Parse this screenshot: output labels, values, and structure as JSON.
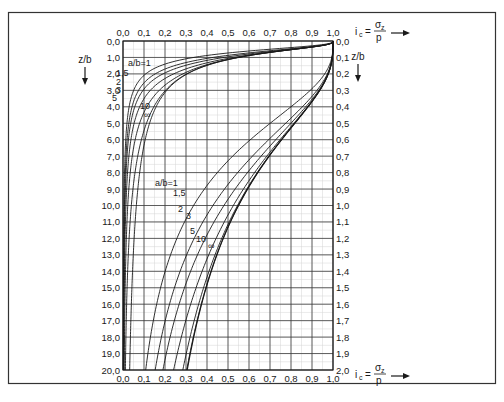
{
  "chart_data": {
    "type": "line",
    "title": "",
    "x_axis": {
      "label_prefix": "i",
      "label_sub": "c",
      "label_eq": "=",
      "label_num": "σ",
      "label_num_sub": "z",
      "label_den": "p",
      "range": [
        0.0,
        1.0
      ],
      "ticks": [
        "0,0",
        "0,1",
        "0,2",
        "0,3",
        "0,4",
        "0,5",
        "0,6",
        "0,7",
        "0,8",
        "0,9",
        "1,0"
      ],
      "positions": [
        "top",
        "bottom"
      ]
    },
    "left_axis": {
      "label": "z/b",
      "range": [
        0.0,
        20.0
      ],
      "inverted": true,
      "ticks": [
        "0,0",
        "1,0",
        "2,0",
        "3,0",
        "4,0",
        "5,0",
        "6,0",
        "7,0",
        "8,0",
        "9,0",
        "10,0",
        "11,0",
        "12,0",
        "13,0",
        "14,0",
        "15,0",
        "16,0",
        "17,0",
        "18,0",
        "19,0",
        "20,0"
      ]
    },
    "right_axis": {
      "label": "z/b",
      "range": [
        0.0,
        2.0
      ],
      "inverted": true,
      "ticks": [
        "0,0",
        "0,1",
        "0,2",
        "0,3",
        "0,4",
        "0,5",
        "0,6",
        "0,7",
        "0,8",
        "0,9",
        "1,0",
        "1,1",
        "1,2",
        "1,3",
        "1,4",
        "1,5",
        "1,6",
        "1,7",
        "1,8",
        "1,9",
        "2,0"
      ]
    },
    "grid": true,
    "minor_grid": true,
    "ratios": [
      "1",
      "1,5",
      "2",
      "3",
      "5",
      "10",
      "∞"
    ],
    "ratio_values": [
      1,
      1.5,
      2,
      3,
      5,
      10,
      1000
    ],
    "families": [
      {
        "name": "left-scale",
        "axis": "left",
        "z_range": [
          0,
          20
        ],
        "label_prefix": "a/b=",
        "labels": [
          "a/b=1",
          "1,5",
          "2",
          "3",
          "5",
          "10",
          "∞"
        ],
        "series": [
          {
            "name": "a/b=1",
            "points": [
              [
                0,
                1.0
              ],
              [
                1,
                0.7
              ],
              [
                2,
                0.34
              ],
              [
                3,
                0.18
              ],
              [
                4,
                0.11
              ],
              [
                6,
                0.05
              ],
              [
                10,
                0.02
              ],
              [
                20,
                0.005
              ]
            ]
          },
          {
            "name": "a/b=1.5",
            "points": [
              [
                0,
                1.0
              ],
              [
                1,
                0.76
              ],
              [
                2,
                0.44
              ],
              [
                3,
                0.25
              ],
              [
                4,
                0.16
              ],
              [
                6,
                0.08
              ],
              [
                10,
                0.03
              ],
              [
                20,
                0.008
              ]
            ]
          },
          {
            "name": "a/b=2",
            "points": [
              [
                0,
                1.0
              ],
              [
                1,
                0.78
              ],
              [
                2,
                0.48
              ],
              [
                3,
                0.3
              ],
              [
                4,
                0.2
              ],
              [
                6,
                0.1
              ],
              [
                10,
                0.04
              ],
              [
                20,
                0.01
              ]
            ]
          },
          {
            "name": "a/b=3",
            "points": [
              [
                0,
                1.0
              ],
              [
                1,
                0.8
              ],
              [
                2,
                0.52
              ],
              [
                3,
                0.35
              ],
              [
                4,
                0.25
              ],
              [
                6,
                0.14
              ],
              [
                10,
                0.06
              ],
              [
                20,
                0.015
              ]
            ]
          },
          {
            "name": "a/b=5",
            "points": [
              [
                0,
                1.0
              ],
              [
                1,
                0.81
              ],
              [
                2,
                0.54
              ],
              [
                3,
                0.38
              ],
              [
                4,
                0.29
              ],
              [
                6,
                0.19
              ],
              [
                10,
                0.09
              ],
              [
                20,
                0.025
              ]
            ]
          },
          {
            "name": "a/b=10",
            "points": [
              [
                0,
                1.0
              ],
              [
                1,
                0.82
              ],
              [
                2,
                0.55
              ],
              [
                3,
                0.4
              ],
              [
                4,
                0.31
              ],
              [
                6,
                0.21
              ],
              [
                10,
                0.13
              ],
              [
                20,
                0.05
              ]
            ]
          },
          {
            "name": "a/b=∞",
            "points": [
              [
                0,
                1.0
              ],
              [
                1,
                0.82
              ],
              [
                2,
                0.55
              ],
              [
                3,
                0.4
              ],
              [
                4,
                0.31
              ],
              [
                6,
                0.21
              ],
              [
                10,
                0.13
              ],
              [
                20,
                0.06
              ]
            ]
          }
        ]
      },
      {
        "name": "right-scale",
        "axis": "right",
        "z_range": [
          0,
          2
        ],
        "label_prefix": "a/b=",
        "labels": [
          "a/b=1",
          "1,5",
          "2",
          "3",
          "5",
          "10",
          "∞"
        ],
        "series": [
          {
            "name": "a/b=1",
            "points": [
              [
                0,
                1.0
              ],
              [
                0.2,
                0.96
              ],
              [
                0.5,
                0.7
              ],
              [
                1.0,
                0.34
              ],
              [
                1.5,
                0.18
              ],
              [
                2.0,
                0.11
              ]
            ]
          },
          {
            "name": "a/b=1.5",
            "points": [
              [
                0,
                1.0
              ],
              [
                0.2,
                0.97
              ],
              [
                0.5,
                0.76
              ],
              [
                1.0,
                0.44
              ],
              [
                1.5,
                0.25
              ],
              [
                2.0,
                0.16
              ]
            ]
          },
          {
            "name": "a/b=2",
            "points": [
              [
                0,
                1.0
              ],
              [
                0.2,
                0.97
              ],
              [
                0.5,
                0.78
              ],
              [
                1.0,
                0.48
              ],
              [
                1.5,
                0.3
              ],
              [
                2.0,
                0.2
              ]
            ]
          },
          {
            "name": "a/b=3",
            "points": [
              [
                0,
                1.0
              ],
              [
                0.2,
                0.97
              ],
              [
                0.5,
                0.8
              ],
              [
                1.0,
                0.52
              ],
              [
                1.5,
                0.35
              ],
              [
                2.0,
                0.25
              ]
            ]
          },
          {
            "name": "a/b=5",
            "points": [
              [
                0,
                1.0
              ],
              [
                0.2,
                0.97
              ],
              [
                0.5,
                0.81
              ],
              [
                1.0,
                0.54
              ],
              [
                1.5,
                0.38
              ],
              [
                2.0,
                0.29
              ]
            ]
          },
          {
            "name": "a/b=10",
            "points": [
              [
                0,
                1.0
              ],
              [
                0.2,
                0.97
              ],
              [
                0.5,
                0.82
              ],
              [
                1.0,
                0.55
              ],
              [
                1.5,
                0.4
              ],
              [
                2.0,
                0.31
              ]
            ]
          },
          {
            "name": "a/b=∞",
            "points": [
              [
                0,
                1.0
              ],
              [
                0.2,
                0.97
              ],
              [
                0.5,
                0.82
              ],
              [
                1.0,
                0.55
              ],
              [
                1.5,
                0.4
              ],
              [
                2.0,
                0.31
              ]
            ]
          }
        ]
      }
    ]
  }
}
